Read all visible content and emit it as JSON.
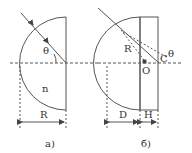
{
  "figure_a": {
    "label": "а)",
    "angle_label": "θ",
    "index_label": "n",
    "radius_label": "R"
  },
  "figure_b": {
    "label": "б)",
    "angle_label": "θ",
    "radius_label": "R",
    "center_label": "O",
    "point_label": "C",
    "depth_label": "D",
    "thickness_label": "H"
  },
  "colors": {
    "stroke": "#555555",
    "background": "#ffffff"
  }
}
